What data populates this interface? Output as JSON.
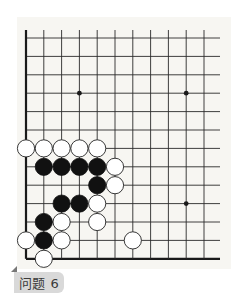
{
  "diagram": {
    "type": "go-problem",
    "label": "问题 6",
    "colors": {
      "panel": "#f7f6f2",
      "grid": "#2a2a2a",
      "edge": "#1a1a1a",
      "black_stone": "#111111",
      "white_stone": "#ffffff",
      "white_stone_outline": "#222222",
      "label_bg": "#d9d9d9",
      "label_text": "#3a3a3a"
    },
    "grid": {
      "columns": 11,
      "rows": 13,
      "x0": 26,
      "y0": 38,
      "dx": 17.8,
      "dy": 18.4,
      "line_extend_top": 8,
      "line_extend_right": 16,
      "edges": [
        "left",
        "bottom"
      ]
    },
    "star_points": [
      {
        "col": 3,
        "row": 3
      },
      {
        "col": 9,
        "row": 3
      },
      {
        "col": 9,
        "row": 9
      }
    ],
    "stones": [
      {
        "color": "white",
        "col": 0,
        "row": 6
      },
      {
        "color": "white",
        "col": 1,
        "row": 6
      },
      {
        "color": "white",
        "col": 2,
        "row": 6
      },
      {
        "color": "white",
        "col": 3,
        "row": 6
      },
      {
        "color": "white",
        "col": 4,
        "row": 6
      },
      {
        "color": "black",
        "col": 1,
        "row": 7
      },
      {
        "color": "black",
        "col": 2,
        "row": 7
      },
      {
        "color": "black",
        "col": 3,
        "row": 7
      },
      {
        "color": "black",
        "col": 4,
        "row": 7
      },
      {
        "color": "white",
        "col": 5,
        "row": 7
      },
      {
        "color": "black",
        "col": 4,
        "row": 8
      },
      {
        "color": "white",
        "col": 5,
        "row": 8
      },
      {
        "color": "black",
        "col": 2,
        "row": 9
      },
      {
        "color": "black",
        "col": 3,
        "row": 9
      },
      {
        "color": "white",
        "col": 4,
        "row": 9
      },
      {
        "color": "black",
        "col": 1,
        "row": 10
      },
      {
        "color": "white",
        "col": 2,
        "row": 10
      },
      {
        "color": "white",
        "col": 4,
        "row": 10
      },
      {
        "color": "white",
        "col": 0,
        "row": 11
      },
      {
        "color": "black",
        "col": 1,
        "row": 11
      },
      {
        "color": "white",
        "col": 2,
        "row": 11
      },
      {
        "color": "white",
        "col": 6,
        "row": 11
      },
      {
        "color": "white",
        "col": 1,
        "row": 12
      }
    ]
  }
}
